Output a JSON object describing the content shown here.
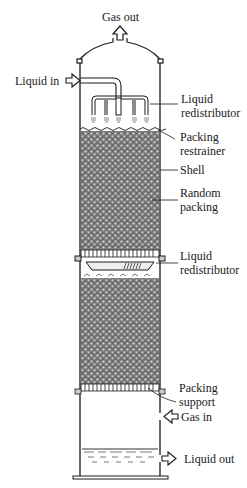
{
  "diagram": {
    "type": "packed absorption column",
    "labels": {
      "gas_out": "Gas out",
      "liquid_in": "Liquid in",
      "liquid_redistributor_top_1": "Liquid",
      "liquid_redistributor_top_2": "redistributor",
      "packing_restrainer_1": "Packing",
      "packing_restrainer_2": "restrainer",
      "shell": "Shell",
      "random_packing_1": "Random",
      "random_packing_2": "packing",
      "liquid_redistributor_mid_1": "Liquid",
      "liquid_redistributor_mid_2": "redistributor",
      "packing_support_1": "Packing",
      "packing_support_2": "support",
      "gas_in": "Gas in",
      "liquid_out": "Liquid out"
    },
    "colors": {
      "line": "#1a1a1a",
      "packing": "#6a6a6a",
      "background": "#ffffff"
    }
  }
}
